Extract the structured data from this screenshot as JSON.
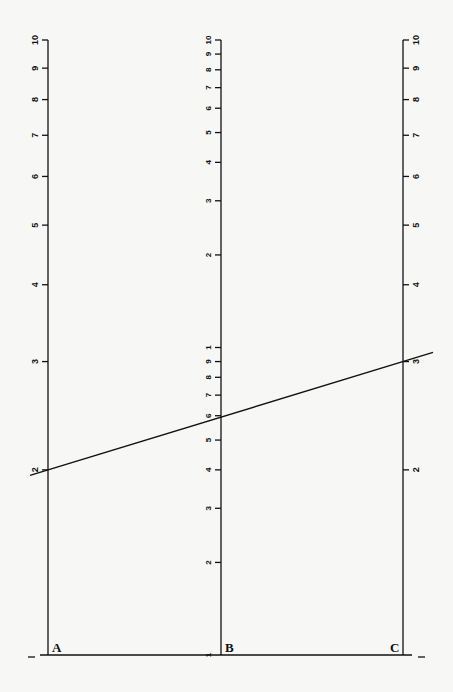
{
  "chart_data": {
    "type": "nomogram",
    "title": "",
    "scales": [
      {
        "name": "A",
        "label": "A",
        "type": "log",
        "range": [
          1,
          10
        ],
        "ticks": [
          1,
          2,
          3,
          4,
          5,
          6,
          7,
          8,
          9,
          10
        ],
        "tick_side": "left"
      },
      {
        "name": "B",
        "label": "B",
        "type": "log",
        "range": [
          1,
          100
        ],
        "ticks": [
          1,
          2,
          3,
          4,
          5,
          6,
          7,
          8,
          9,
          10,
          20,
          30,
          40,
          50,
          60,
          70,
          80,
          90,
          100
        ],
        "tick_labels": [
          "1",
          "2",
          "3",
          "4",
          "5",
          "6",
          "7",
          "8",
          "9",
          "1",
          "2",
          "3",
          "4",
          "5",
          "6",
          "7",
          "8",
          "9",
          "10"
        ],
        "tick_side": "left"
      },
      {
        "name": "C",
        "label": "C",
        "type": "log",
        "range": [
          1,
          10
        ],
        "ticks": [
          1,
          2,
          3,
          4,
          5,
          6,
          7,
          8,
          9,
          10
        ],
        "tick_side": "right"
      }
    ],
    "isopleth": {
      "A": 2,
      "B": 6,
      "C": 3
    },
    "baseline": true
  },
  "labels": {
    "axis_a": "A",
    "axis_b": "B",
    "axis_c": "C"
  },
  "colors": {
    "ink": "#111111",
    "paper": "#f7f7f5"
  }
}
